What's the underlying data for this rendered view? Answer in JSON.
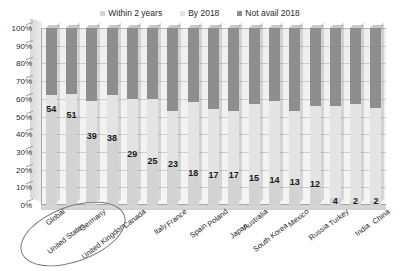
{
  "legend": {
    "position": "top-center",
    "items": [
      {
        "label": "Within 2 years",
        "color": "#d3d3d3"
      },
      {
        "label": "By 2018",
        "color": "#e4e4e4"
      },
      {
        "label": "Not avail 2018",
        "color": "#8e8e8e"
      }
    ]
  },
  "yaxis": {
    "ticks": [
      "100%",
      "90%",
      "80%",
      "70%",
      "60%",
      "50%",
      "40%",
      "30%",
      "20%",
      "10%",
      "0%"
    ]
  },
  "annotation": {
    "ellipse_label": "highlight-global-united-states"
  },
  "chart_data": {
    "type": "bar",
    "title": "",
    "subtitle": "",
    "xlabel": "",
    "ylabel": "",
    "ylim": [
      0,
      100
    ],
    "ytick_labels": [
      "0%",
      "10%",
      "20%",
      "30%",
      "40%",
      "50%",
      "60%",
      "70%",
      "80%",
      "90%",
      "100%"
    ],
    "grid": true,
    "stacked": true,
    "stack_total": 100,
    "legend_position": "top-center",
    "categories": [
      "Global",
      "United States",
      "Germany",
      "United Kingdom",
      "Canada",
      "Italy",
      "France",
      "Spain",
      "Poland",
      "Japan",
      "Australia",
      "South Korea",
      "Mexico",
      "Russia",
      "Turkey",
      "India",
      "China"
    ],
    "series": [
      {
        "name": "Within 2 years",
        "color": "#d3d3d3",
        "values": [
          54,
          51,
          39,
          38,
          29,
          25,
          23,
          18,
          17,
          17,
          15,
          14,
          13,
          12,
          4,
          2,
          2
        ]
      },
      {
        "name": "By 2018",
        "color": "#e4e4e4",
        "values": [
          8,
          12,
          20,
          24,
          31,
          35,
          30,
          40,
          37,
          36,
          42,
          45,
          40,
          44,
          52,
          55,
          53
        ]
      },
      {
        "name": "Not avail 2018",
        "color": "#8e8e8e",
        "values": [
          38,
          37,
          41,
          38,
          40,
          40,
          47,
          42,
          46,
          47,
          43,
          41,
          47,
          44,
          44,
          43,
          45
        ]
      }
    ],
    "data_labels": {
      "series": "Within 2 years",
      "values": [
        "54",
        "51",
        "39",
        "38",
        "29",
        "25",
        "23",
        "18",
        "17",
        "17",
        "15",
        "14",
        "13",
        "12",
        "4",
        "2",
        "2"
      ]
    }
  }
}
